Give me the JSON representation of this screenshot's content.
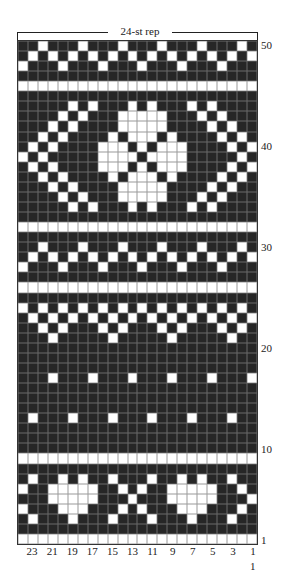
{
  "chart_data": {
    "type": "knitting-colorwork-chart",
    "title": "24-st rep",
    "repeat_label": "24-st rep",
    "columns": 24,
    "rows": 50,
    "colors": {
      "dark": "#262626",
      "light": "#ffffff",
      "gridline": "#6a6a6a"
    },
    "row_labels": [
      {
        "row": 50,
        "text": "50"
      },
      {
        "row": 40,
        "text": "40"
      },
      {
        "row": 30,
        "text": "30"
      },
      {
        "row": 20,
        "text": "20"
      },
      {
        "row": 10,
        "text": "10"
      },
      {
        "row": 1,
        "text": "1"
      }
    ],
    "col_labels": [
      "23",
      "21",
      "19",
      "17",
      "15",
      "13",
      "11",
      "9",
      "7",
      "5",
      "3",
      "1"
    ],
    "corner_label": "1",
    "light_cells_by_row_note": "column index 0 = leftmost (stitch 24), 23 = rightmost (stitch 1)",
    "light_cells_by_row": {
      "50": [
        2,
        6,
        10,
        14,
        18,
        22
      ],
      "49": [
        1,
        3,
        5,
        7,
        9,
        11,
        13,
        15,
        17,
        19,
        21,
        23
      ],
      "48": [
        0,
        4,
        8,
        12,
        16,
        20
      ],
      "47": [],
      "46": "all",
      "45": [],
      "44": [
        5,
        7,
        11,
        13,
        17,
        19
      ],
      "43": [
        4,
        6,
        10,
        11,
        12,
        13,
        14,
        18,
        20
      ],
      "42": [
        3,
        5,
        10,
        11,
        12,
        13,
        14,
        19,
        21
      ],
      "41": [
        2,
        4,
        9,
        11,
        12,
        13,
        15,
        20,
        22
      ],
      "40": [
        1,
        3,
        8,
        9,
        10,
        12,
        14,
        15,
        16,
        21,
        23
      ],
      "39": [
        0,
        2,
        8,
        9,
        10,
        11,
        13,
        14,
        15,
        16,
        22
      ],
      "38": [
        1,
        3,
        8,
        9,
        10,
        12,
        14,
        15,
        16,
        21,
        23
      ],
      "37": [
        2,
        4,
        9,
        11,
        12,
        13,
        15,
        20,
        22
      ],
      "36": [
        3,
        5,
        10,
        11,
        12,
        13,
        14,
        19,
        21
      ],
      "35": [
        4,
        6,
        10,
        11,
        12,
        13,
        14,
        18,
        20
      ],
      "34": [
        5,
        7,
        11,
        13,
        17,
        19
      ],
      "33": [],
      "32": "all",
      "31": [],
      "30": [
        2,
        6,
        10,
        14,
        18,
        22
      ],
      "29": [
        1,
        3,
        5,
        7,
        9,
        11,
        13,
        15,
        17,
        19,
        21,
        23
      ],
      "28": [
        0,
        4,
        8,
        12,
        16,
        20
      ],
      "27": [],
      "26": "all",
      "25": [],
      "24": [
        0,
        2,
        4,
        6,
        8,
        10,
        12,
        14,
        16,
        18,
        20,
        22
      ],
      "23": [
        1,
        3,
        5,
        7,
        9,
        11,
        13,
        15,
        17,
        19,
        21,
        23
      ],
      "22": [
        2,
        4,
        8,
        10,
        14,
        16,
        20,
        22
      ],
      "21": [
        3,
        9,
        15,
        21
      ],
      "20": [],
      "19": [],
      "18": [],
      "17": [
        3,
        7,
        11,
        15,
        19,
        23
      ],
      "16": [],
      "15": [],
      "14": [],
      "13": [
        1,
        5,
        9,
        13,
        17,
        21
      ],
      "12": [],
      "11": [],
      "10": [],
      "9": "all",
      "8": [],
      "7": [
        1,
        4,
        6,
        9,
        13,
        16,
        18,
        21
      ],
      "6": [
        0,
        3,
        4,
        5,
        6,
        7,
        10,
        12,
        15,
        16,
        17,
        18,
        19,
        22
      ],
      "5": [
        3,
        4,
        5,
        6,
        7,
        11,
        15,
        16,
        17,
        18,
        19,
        23
      ],
      "4": [
        0,
        4,
        5,
        6,
        10,
        12,
        16,
        17,
        18,
        22
      ],
      "3": [
        1,
        5,
        9,
        13,
        17,
        21
      ],
      "2": [],
      "1": "all"
    }
  }
}
